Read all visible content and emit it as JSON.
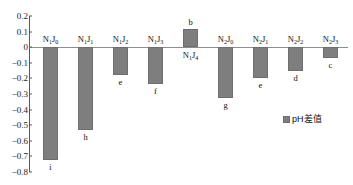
{
  "chart_data": {
    "type": "bar",
    "title": "",
    "xlabel": "",
    "ylabel": "",
    "ylim": [
      -0.8,
      0.2
    ],
    "grid": false,
    "legend_position": "right",
    "categories": [
      "N1J0",
      "N1J1",
      "N1J2",
      "N1J3",
      "N1J4",
      "N2J0",
      "N2J1",
      "N2J2",
      "N2J3"
    ],
    "category_labels": [
      {
        "base": "N",
        "base_sub": "1",
        "mid": "J",
        "mid_sub": "0"
      },
      {
        "base": "N",
        "base_sub": "1",
        "mid": "J",
        "mid_sub": "1"
      },
      {
        "base": "N",
        "base_sub": "1",
        "mid": "J",
        "mid_sub": "2"
      },
      {
        "base": "N",
        "base_sub": "1",
        "mid": "J",
        "mid_sub": "3"
      },
      {
        "base": "N",
        "base_sub": "1",
        "mid": "J",
        "mid_sub": "4"
      },
      {
        "base": "N",
        "base_sub": "2",
        "mid": "J",
        "mid_sub": "0"
      },
      {
        "base": "N",
        "base_sub": "2",
        "mid": "J",
        "mid_sub": "1"
      },
      {
        "base": "N",
        "base_sub": "2",
        "mid": "J",
        "mid_sub": "2"
      },
      {
        "base": "N",
        "base_sub": "2",
        "mid": "J",
        "mid_sub": "3"
      }
    ],
    "values": [
      -0.72,
      -0.53,
      -0.18,
      -0.235,
      0.115,
      -0.325,
      -0.195,
      -0.15,
      -0.07
    ],
    "point_labels": [
      "i",
      "h",
      "e",
      "f",
      "b",
      "g",
      "e",
      "d",
      "c"
    ],
    "series": [
      {
        "name": "pH差值",
        "values": [
          -0.72,
          -0.53,
          -0.18,
          -0.235,
          0.115,
          -0.325,
          -0.195,
          -0.15,
          -0.07
        ],
        "color": "#7e7e7e"
      }
    ],
    "yticks": [
      "0.2",
      "0.1",
      "0",
      "−0.1",
      "−0.2",
      "−0.3",
      "−0.4",
      "−0.5",
      "−0.6",
      "−0.7",
      "−0.8"
    ],
    "ytick_values": [
      0.2,
      0.1,
      0,
      -0.1,
      -0.2,
      -0.3,
      -0.4,
      -0.5,
      -0.6,
      -0.7,
      -0.8
    ]
  },
  "legend": {
    "label": "pH差值",
    "swatch_color": "#7e7e7e"
  },
  "colors": {
    "bar": "#7e7e7e",
    "bar_border": "#6e6e6e",
    "axis": "#5a5a5a",
    "zero_line": "#8d8d8d",
    "text": "#111111",
    "background": "#ffffff"
  }
}
